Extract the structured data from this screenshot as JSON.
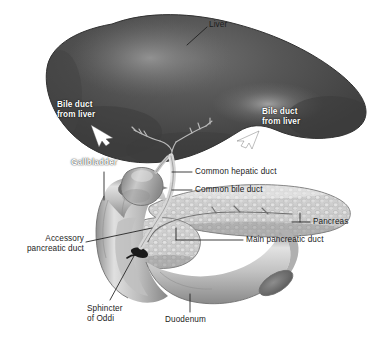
{
  "figure": {
    "style": "grayscale medical illustration",
    "background_color": "#ffffff"
  },
  "colors": {
    "liver_dark": "#4a4a4a",
    "liver_mid": "#5a5a5a",
    "liver_highlight": "#8a8a8a",
    "liver_edge": "#3a3a3a",
    "duct_light": "#d8d8d8",
    "duct_shadow": "#9a9a9a",
    "pancreas_light": "#d2d2d2",
    "pancreas_mid": "#b4b4b4",
    "pancreas_dark": "#8e8e8e",
    "duodenum_light": "#cccccc",
    "duodenum_mid": "#a6a6a6",
    "duodenum_dark": "#7c7c7c",
    "label_black": "#1c1c1c",
    "label_white": "#ffffff",
    "leader_line": "#1c1c1c",
    "sphincter_dark": "#141414"
  },
  "labels": {
    "liver": "Liver",
    "bile_duct_left_line1": "Bile duct",
    "bile_duct_left_line2": "from liver",
    "bile_duct_right_line1": "Bile duct",
    "bile_duct_right_line2": "from liver",
    "gallbladder": "Gallbladder",
    "common_hepatic_duct": "Common hepatic duct",
    "common_bile_duct": "Common bile duct",
    "pancreas": "Pancreas",
    "main_pancreatic_duct": "Main pancreatic duct",
    "accessory_pancreatic_duct_line1": "Accessory",
    "accessory_pancreatic_duct_line2": "pancreatic duct",
    "sphincter_of_oddi_line1": "Sphincter",
    "sphincter_of_oddi_line2": "of Oddi",
    "duodenum": "Duodenum"
  }
}
